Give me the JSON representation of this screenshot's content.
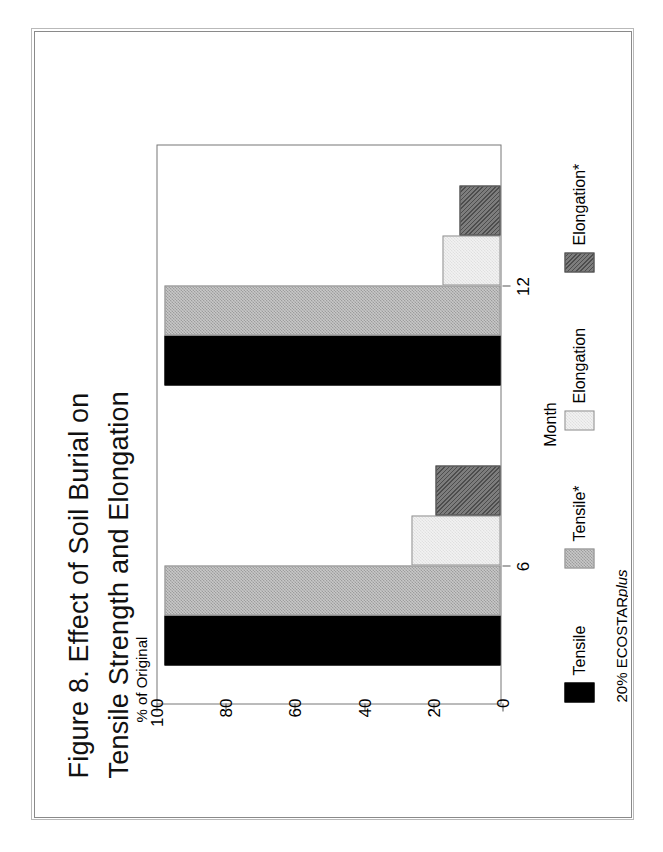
{
  "figure": {
    "title_line1": "Figure 8.  Effect of Soil Burial on",
    "title_line2": "Tensile Strength and Elongation",
    "ylabel": "% of Original",
    "xlabel": "Month",
    "footnote_1_prefix": "20% ECOSTAR",
    "footnote_1_italic": "plus",
    "footnote_2": "* soil exposed to sunlight"
  },
  "chart_data": {
    "type": "bar",
    "title": "Figure 8.  Effect of Soil Burial on Tensile Strength and Elongation",
    "xlabel": "Month",
    "ylabel": "% of Original",
    "categories": [
      "6",
      "12"
    ],
    "ylim": [
      0,
      100
    ],
    "yticks": [
      0,
      20,
      40,
      60,
      80,
      100
    ],
    "grid": false,
    "legend_position": "below",
    "orientation": "vertical",
    "series": [
      {
        "name": "Tensile",
        "color": "#000000",
        "fill": "solid",
        "values": [
          98,
          98
        ]
      },
      {
        "name": "Tensile*",
        "color": "#c8c8c8",
        "fill": "fine-check",
        "values": [
          98,
          98
        ]
      },
      {
        "name": "Elongation",
        "color": "#f2f2f2",
        "fill": "light",
        "values": [
          26,
          17
        ]
      },
      {
        "name": "Elongation*",
        "color": "#7d7d7d",
        "fill": "hatch",
        "values": [
          19,
          12
        ]
      }
    ]
  },
  "legend": {
    "items": [
      {
        "label": "Tensile"
      },
      {
        "label": "Tensile*"
      },
      {
        "label": "Elongation"
      },
      {
        "label": "Elongation*"
      }
    ]
  },
  "axis": {
    "ytick_labels": [
      "100",
      "80",
      "60",
      "40",
      "20",
      "0"
    ],
    "xtick_labels": [
      "6",
      "12"
    ]
  }
}
